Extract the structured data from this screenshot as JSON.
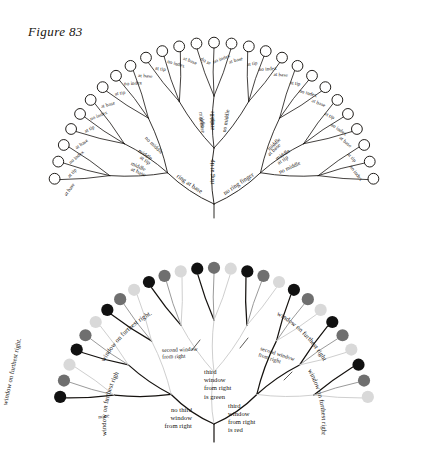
{
  "figure": {
    "title": "Figure 83",
    "caption_visible": false
  },
  "colors": {
    "ink": "#16130f",
    "paper": "#ffffff",
    "node_black": "#111111",
    "node_dark_gray": "#6f6f6f",
    "node_mid_gray": "#a8a8a8",
    "node_light_gray": "#d9d9d9",
    "branch_black": "#15120f",
    "branch_gray": "#9a9a9a",
    "branch_light": "#cfcfcf"
  },
  "chart_data": {
    "type": "diagram",
    "subtype": "radial-decision-tree",
    "title": "Figure 83",
    "panels": [
      {
        "id": "upper-tree",
        "name": "hand-finger-tree",
        "node_style": "open-circle",
        "depth": 3,
        "leaf_count": 27,
        "root_label": "",
        "level1_labels": [
          "no ring finger",
          "ring at tip",
          "ring at base"
        ],
        "level2_labels": [
          "no middle",
          "middle at tip",
          "middle at base"
        ],
        "level3_labels": [
          "no index",
          "at tip",
          "at base"
        ],
        "level1": [
          {
            "label": "no ring finger",
            "children": [
              {
                "label": "no middle",
                "leaves": [
                  "no index",
                  "at tip",
                  "at base"
                ]
              },
              {
                "label": "middle at tip",
                "leaves": [
                  "no index",
                  "at tip",
                  "at base"
                ]
              },
              {
                "label": "middle at base",
                "leaves": [
                  "no index",
                  "at tip",
                  "at base"
                ]
              }
            ]
          },
          {
            "label": "ring at tip",
            "children": [
              {
                "label": "no middle",
                "leaves": [
                  "no index",
                  "at tip",
                  "at base"
                ]
              },
              {
                "label": "middle at tip",
                "leaves": [
                  "no index",
                  "at tip",
                  "at base"
                ]
              },
              {
                "label": "middle at base",
                "leaves": [
                  "no index",
                  "at tip",
                  "at base"
                ]
              }
            ]
          },
          {
            "label": "ring at base",
            "children": [
              {
                "label": "no middle",
                "leaves": [
                  "no index",
                  "at tip",
                  "at base"
                ]
              },
              {
                "label": "middle at tip",
                "leaves": [
                  "no index",
                  "at tip",
                  "at base"
                ]
              },
              {
                "label": "middle at base",
                "leaves": [
                  "no index",
                  "at tip",
                  "at base"
                ]
              }
            ]
          }
        ]
      },
      {
        "id": "lower-tree",
        "name": "window-color-tree",
        "node_style": "filled-circle",
        "depth": 3,
        "leaf_count": 27,
        "level1_labels": [
          "none",
          "third window from right is green",
          "third window from right is red"
        ],
        "level1_alt_labels": [
          "no third window from right"
        ],
        "level2_labels": [
          "second window from right"
        ],
        "level3_labels": [
          "window on furthest right"
        ],
        "level1": [
          {
            "label": "none",
            "children": [
              {
                "label": "second window from right",
                "leaves": [
                  "window on furthest right"
                ]
              },
              {
                "label": "second window from right",
                "leaves": [
                  "window on furthest right"
                ]
              },
              {
                "label": "second window from right",
                "leaves": [
                  "window on furthest right"
                ]
              }
            ]
          },
          {
            "label": "no third window from right",
            "children": [
              {
                "label": "second window from right",
                "leaves": [
                  "window on furthest right"
                ]
              },
              {
                "label": "second window from right",
                "leaves": [
                  "window on furthest right"
                ]
              },
              {
                "label": "second window from right",
                "leaves": [
                  "window on furthest right"
                ]
              }
            ]
          },
          {
            "label": "third window from right is red",
            "children": [
              {
                "label": "second window from right",
                "leaves": [
                  "window on furthest right"
                ]
              },
              {
                "label": "second window from right",
                "leaves": [
                  "window on furthest right"
                ]
              },
              {
                "label": "second window from right",
                "leaves": [
                  "window on furthest right"
                ]
              }
            ]
          }
        ]
      }
    ]
  },
  "upper": {
    "root_left": "no ring finger",
    "root_center": "ring at tip",
    "root_right": "ring at base",
    "mid_l1": "no middle",
    "mid_l2": "middle at tip",
    "mid_l3": "middle at base",
    "mid_c1": "no middle",
    "mid_c2": "middle at tip",
    "mid_c3": "middle at base",
    "mid_r1": "no middle",
    "mid_r2": "middle at tip",
    "mid_r3": "middle at base",
    "leaf_a": "no index",
    "leaf_b": "at tip",
    "leaf_c": "at base"
  },
  "lower": {
    "none": "none",
    "no_third": "no third window from right",
    "third_green": "third window from right is green",
    "third_red": "third window from right is red",
    "second_window": "second window from right",
    "furthest": "window on furthest right",
    "furthest_period": "window on furthest right."
  }
}
